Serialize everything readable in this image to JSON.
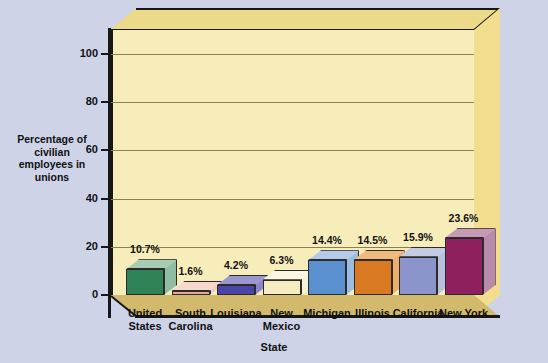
{
  "chart_data": {
    "type": "bar",
    "title": "",
    "xlabel": "State",
    "ylabel": "Percentage of civilian employees in unions",
    "ylim": [
      0,
      110
    ],
    "yticks": [
      0,
      20,
      40,
      60,
      80,
      100
    ],
    "ytick_labels": [
      "0",
      "20",
      "40",
      "60",
      "80",
      "100"
    ],
    "grid": true,
    "legend": "none",
    "style": "3d-isometric-bars",
    "categories": [
      "United States",
      "South Carolina",
      "Louisiana",
      "New Mexico",
      "Michigan",
      "Illinois",
      "California",
      "New York"
    ],
    "category_lines": [
      [
        "United",
        "States"
      ],
      [
        "South",
        "Carolina"
      ],
      [
        "Louisiana",
        ""
      ],
      [
        "New",
        "Mexico"
      ],
      [
        "Michigan",
        ""
      ],
      [
        "Illinois",
        ""
      ],
      [
        "California",
        ""
      ],
      [
        "New York",
        ""
      ]
    ],
    "values": [
      10.7,
      1.6,
      4.2,
      6.3,
      14.4,
      14.5,
      15.9,
      23.6
    ],
    "value_labels": [
      "10.7%",
      "1.6%",
      "4.2%",
      "6.3%",
      "14.4%",
      "14.5%",
      "15.9%",
      "23.6%"
    ],
    "bar_colors": [
      "#2f8256",
      "#e8a893",
      "#4b45a8",
      "#f5edbf",
      "#5a8fd0",
      "#d97a22",
      "#8b95cc",
      "#8e2060"
    ],
    "bar_top_colors": [
      "#a8cbb4",
      "#f6d8cc",
      "#9a96cf",
      "#fbf7e2",
      "#b3cbe8",
      "#f0b97e",
      "#c5cbe4",
      "#c59ab5"
    ],
    "bar_side_colors": [
      "#8fbda3",
      "#f3cbbb",
      "#8b86c6",
      "#f9f2d4",
      "#9dbde0",
      "#edae69",
      "#b9c0de",
      "#b98aa9"
    ]
  },
  "colors": {
    "page_background": "#ced3e8",
    "plot_back_wall": "#f7edba",
    "plot_top_face": "#ecd98a",
    "plot_side_face": "#f2de8e",
    "plot_floor": "#d3b96b",
    "axis": "#171717",
    "gridline": "#8d7f4e",
    "text": "#111111"
  }
}
